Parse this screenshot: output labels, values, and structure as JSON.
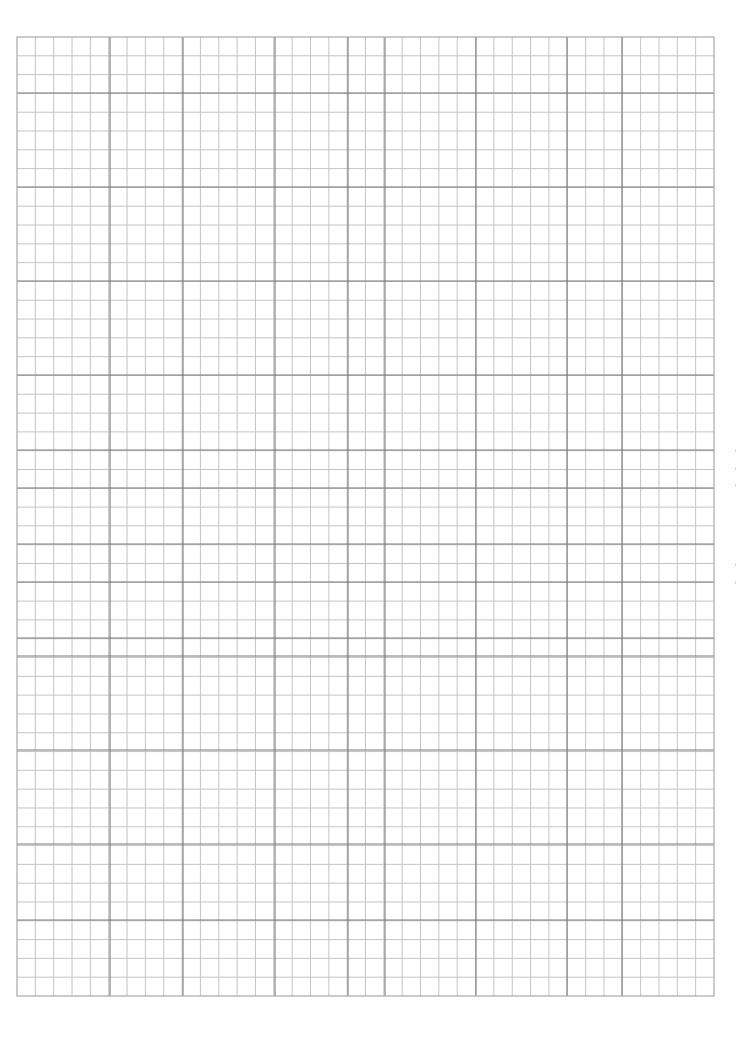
{
  "page": {
    "background_color": "#ffffff",
    "width": 749,
    "height": 1049
  },
  "grid": {
    "left": 17,
    "top": 37,
    "right": 714,
    "bottom": 996,
    "columns": 38,
    "rows": 51,
    "minor_line_color": "#c4c4c4",
    "major_line_color": "#7a7a7a",
    "border_color": "#a8a8a8",
    "major_vertical_x": [
      110,
      183,
      275,
      348,
      385,
      476,
      567,
      622
    ],
    "major_horizontal_y": [
      93,
      187,
      281,
      375,
      450,
      488,
      544,
      582,
      638,
      656,
      750,
      844,
      920
    ]
  },
  "scan_marks": [
    {
      "x": 735,
      "y": 449
    },
    {
      "x": 735,
      "y": 467
    },
    {
      "x": 735,
      "y": 484
    },
    {
      "x": 735,
      "y": 563
    },
    {
      "x": 735,
      "y": 581
    }
  ]
}
